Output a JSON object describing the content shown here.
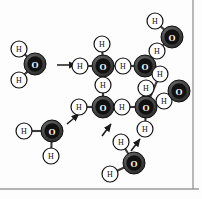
{
  "figure": {
    "background_color": "#fdfdfd",
    "border_color": "#9a9a9a",
    "bond_color": "#3a3a3a",
    "arrow_color": "#1a1a1a"
  },
  "legend": {
    "oxygen_label": "O",
    "hydrogen_label": "H",
    "oxygen_fill": "#3a3a3a",
    "oxygen_ring": "#7d7d7d",
    "oxygen_core": "#111111",
    "hydrogen_fill": "#ffffff",
    "hydrogen_stroke": "#111111"
  },
  "atoms": [
    {
      "id": "o-left",
      "element": "O",
      "label": "O",
      "x": 35,
      "y": 64,
      "r": 11
    },
    {
      "id": "h-left-upper",
      "element": "H",
      "label": "H",
      "x": 19,
      "y": 49,
      "r": 8
    },
    {
      "id": "h-left-lower",
      "element": "H",
      "label": "H",
      "x": 19,
      "y": 80,
      "r": 8
    },
    {
      "id": "o-top-center",
      "element": "O",
      "label": "O",
      "x": 103,
      "y": 66,
      "r": 11
    },
    {
      "id": "h-tc-top",
      "element": "H",
      "label": "H",
      "x": 102,
      "y": 44,
      "r": 8
    },
    {
      "id": "h-tc-left",
      "element": "H",
      "label": "H",
      "x": 80,
      "y": 66,
      "r": 8
    },
    {
      "id": "h-tc-right",
      "element": "H",
      "label": "H",
      "x": 123,
      "y": 66,
      "r": 8
    },
    {
      "id": "h-tc-bottom",
      "element": "H",
      "label": "H",
      "x": 103,
      "y": 85,
      "r": 8
    },
    {
      "id": "o-upper-right",
      "element": "O",
      "label": "O",
      "x": 145,
      "y": 66,
      "r": 11
    },
    {
      "id": "h-ur-up",
      "element": "H",
      "label": "H",
      "x": 157,
      "y": 51,
      "r": 8
    },
    {
      "id": "h-ur-right",
      "element": "H",
      "label": "H",
      "x": 160,
      "y": 74,
      "r": 8
    },
    {
      "id": "o-corner",
      "element": "O",
      "label": "O",
      "x": 172,
      "y": 37,
      "r": 11
    },
    {
      "id": "h-corner-up",
      "element": "H",
      "label": "H",
      "x": 155,
      "y": 21,
      "r": 8
    },
    {
      "id": "o-mid-left",
      "element": "O",
      "label": "O",
      "x": 103,
      "y": 107,
      "r": 11
    },
    {
      "id": "h-ml-left",
      "element": "H",
      "label": "H",
      "x": 79,
      "y": 107,
      "r": 8
    },
    {
      "id": "h-ml-right",
      "element": "H",
      "label": "H",
      "x": 122,
      "y": 107,
      "r": 8
    },
    {
      "id": "o-mid-right",
      "element": "O",
      "label": "O",
      "x": 146,
      "y": 107,
      "r": 11
    },
    {
      "id": "h-mr-up",
      "element": "H",
      "label": "H",
      "x": 146,
      "y": 88,
      "r": 8
    },
    {
      "id": "h-mr-right",
      "element": "H",
      "label": "H",
      "x": 164,
      "y": 101,
      "r": 8
    },
    {
      "id": "h-mr-down",
      "element": "H",
      "label": "H",
      "x": 145,
      "y": 129,
      "r": 8
    },
    {
      "id": "o-far-right",
      "element": "O",
      "label": "O",
      "x": 179,
      "y": 91,
      "r": 11
    },
    {
      "id": "o-bot-left",
      "element": "O",
      "label": "O",
      "x": 52,
      "y": 131,
      "r": 11
    },
    {
      "id": "h-bl-left",
      "element": "H",
      "label": "H",
      "x": 24,
      "y": 131,
      "r": 8
    },
    {
      "id": "h-bl-down",
      "element": "H",
      "label": "H",
      "x": 51,
      "y": 156,
      "r": 8
    },
    {
      "id": "o-bottom",
      "element": "O",
      "label": "O",
      "x": 134,
      "y": 163,
      "r": 11
    },
    {
      "id": "h-bot-up",
      "element": "H",
      "label": "H",
      "x": 121,
      "y": 142,
      "r": 8
    },
    {
      "id": "h-bot-left",
      "element": "H",
      "label": "H",
      "x": 110,
      "y": 174,
      "r": 8
    }
  ],
  "bonds": [
    {
      "from": "o-left",
      "to": "h-left-upper"
    },
    {
      "from": "o-left",
      "to": "h-left-lower"
    },
    {
      "from": "o-top-center",
      "to": "h-tc-top"
    },
    {
      "from": "o-top-center",
      "to": "h-tc-left"
    },
    {
      "from": "o-top-center",
      "to": "h-tc-right"
    },
    {
      "from": "o-top-center",
      "to": "h-tc-bottom"
    },
    {
      "from": "h-tc-right",
      "to": "o-upper-right"
    },
    {
      "from": "h-tc-bottom",
      "to": "o-mid-left"
    },
    {
      "from": "o-upper-right",
      "to": "h-ur-up"
    },
    {
      "from": "o-upper-right",
      "to": "h-ur-right"
    },
    {
      "from": "h-ur-up",
      "to": "o-corner"
    },
    {
      "from": "o-corner",
      "to": "h-corner-up"
    },
    {
      "from": "h-ur-right",
      "to": "o-mid-right"
    },
    {
      "from": "o-mid-left",
      "to": "h-ml-left"
    },
    {
      "from": "o-mid-left",
      "to": "h-ml-right"
    },
    {
      "from": "h-ml-right",
      "to": "o-mid-right"
    },
    {
      "from": "o-mid-right",
      "to": "h-mr-up"
    },
    {
      "from": "o-mid-right",
      "to": "h-mr-right"
    },
    {
      "from": "o-mid-right",
      "to": "h-mr-down"
    },
    {
      "from": "h-mr-right",
      "to": "o-far-right"
    },
    {
      "from": "o-bot-left",
      "to": "h-bl-left"
    },
    {
      "from": "o-bot-left",
      "to": "h-bl-down"
    },
    {
      "from": "o-bottom",
      "to": "h-bot-up"
    },
    {
      "from": "o-bottom",
      "to": "h-bot-left"
    }
  ],
  "arrows": [
    {
      "id": "arrow-incoming-left",
      "x1": 57,
      "y1": 65,
      "x2": 76,
      "y2": 65
    },
    {
      "id": "arrow-from-bot-left",
      "x1": 67,
      "y1": 124,
      "x2": 79,
      "y2": 114
    },
    {
      "id": "arrow-from-bottom-a",
      "x1": 102,
      "y1": 136,
      "x2": 111,
      "y2": 124
    },
    {
      "id": "arrow-from-bottom-b",
      "x1": 131,
      "y1": 151,
      "x2": 140,
      "y2": 139
    }
  ],
  "borders": {
    "right_line_x": 193,
    "bottom_line_y": 189
  }
}
